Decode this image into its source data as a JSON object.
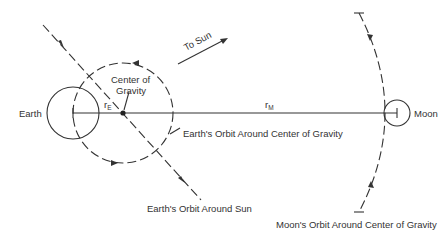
{
  "diagram": {
    "title": "",
    "labels": {
      "earth": "Earth",
      "moon": "Moon",
      "center_of_gravity_line1": "Center of",
      "center_of_gravity_line2": "Gravity",
      "r_e_main": "r",
      "r_e_sub": "E",
      "r_m_main": "r",
      "r_m_sub": "M",
      "to_sun": "To Sun",
      "earth_orbit_cog": "Earth's Orbit Around Center of Gravity",
      "earth_orbit_sun": "Earth's Orbit Around Sun",
      "moon_orbit_cog": "Moon's Orbit Around Center of Gravity"
    },
    "nodes": [
      {
        "id": "earth",
        "label": "Earth",
        "shape": "circle"
      },
      {
        "id": "center_of_gravity",
        "label": "Center of Gravity",
        "shape": "dot"
      },
      {
        "id": "moon",
        "label": "Moon",
        "shape": "circle"
      }
    ],
    "edges": [
      {
        "from": "earth",
        "to": "center_of_gravity",
        "label": "rE"
      },
      {
        "from": "center_of_gravity",
        "to": "moon",
        "label": "rM"
      }
    ],
    "colors": {
      "ink": "#333333",
      "background": "#ffffff"
    }
  }
}
